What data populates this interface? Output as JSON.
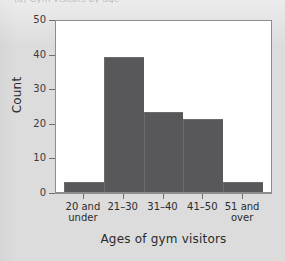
{
  "figure": {
    "caption_fragment": "(a) Gym visitors by age",
    "background_color": "#dcdcdc",
    "plot_background_color": "#ffffff",
    "bar_color": "#58585a",
    "axis_color": "#8d8d8d"
  },
  "chart_data": {
    "type": "bar",
    "title": "",
    "subtitle": "",
    "xlabel": "Ages of gym visitors",
    "ylabel": "Count",
    "categories": [
      "20 and\nunder",
      "21–30",
      "31–40",
      "41–50",
      "51 and\nover"
    ],
    "values": [
      3,
      39,
      23,
      21,
      3
    ],
    "ylim": [
      0,
      50
    ],
    "ytick_labels": [
      "0",
      "10",
      "20",
      "30",
      "40",
      "50"
    ],
    "ytick_values": [
      0,
      10,
      20,
      30,
      40,
      50
    ],
    "grid": false,
    "legend": false,
    "legend_position": "none"
  }
}
